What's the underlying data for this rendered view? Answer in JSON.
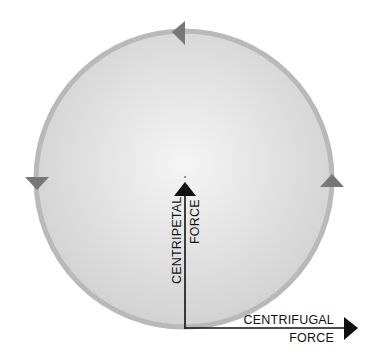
{
  "diagram": {
    "centripetal": {
      "line1": "CENTRIPETAL",
      "line2": "FORCE"
    },
    "centrifugal": {
      "line1": "CENTRIFUGAL",
      "line2": "FORCE"
    },
    "rotation_direction": "counter-clockwise",
    "colors": {
      "disk_center": "#f4f4f4",
      "disk_edge": "#d4d4d4",
      "rim": "#b8b8b8",
      "rim_arrows": "#777777",
      "force_arrows": "#111111"
    }
  }
}
